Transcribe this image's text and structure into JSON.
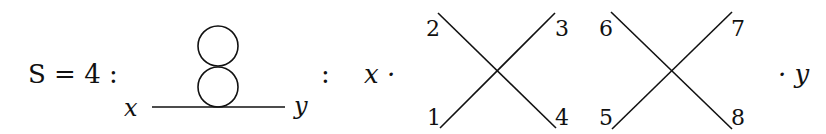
{
  "equation": {
    "lhs": "S = 4 :",
    "separator": ":",
    "left_factor": "x ·",
    "right_factor": "· y"
  },
  "feynman_diagram": {
    "left_label": "x",
    "right_label": "y",
    "loops": 2,
    "description": "double-bubble (figure-eight) tadpole on propagator"
  },
  "vertices": [
    {
      "labels": {
        "top_left": "2",
        "top_right": "3",
        "bottom_left": "1",
        "bottom_right": "4"
      }
    },
    {
      "labels": {
        "top_left": "6",
        "top_right": "7",
        "bottom_left": "5",
        "bottom_right": "8"
      }
    }
  ]
}
